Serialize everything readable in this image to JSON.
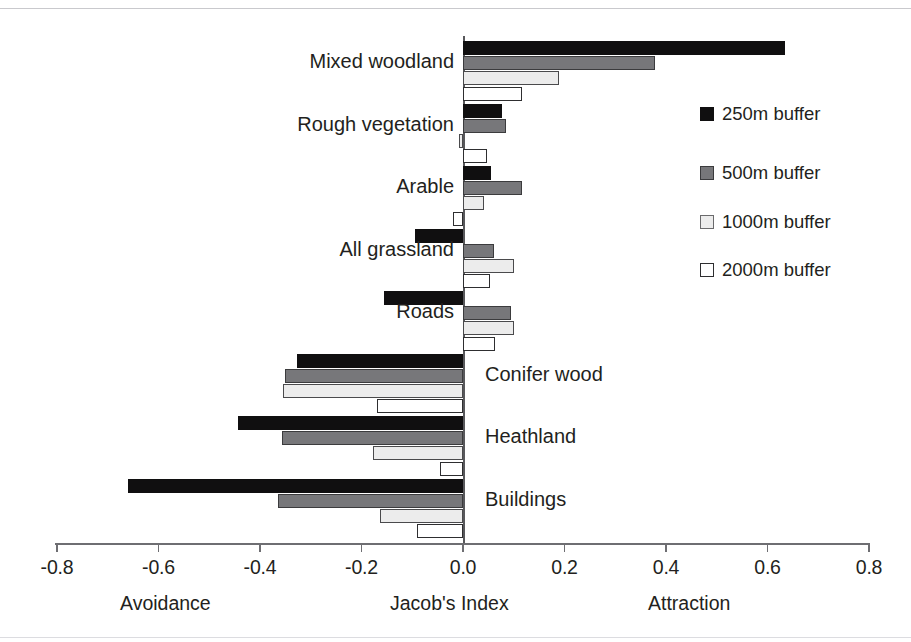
{
  "chart_data": {
    "type": "bar",
    "orientation": "horizontal",
    "title": "",
    "xlabel": "Jacob's Index",
    "ylabel": "",
    "xlim": [
      -0.8,
      0.8
    ],
    "grid": false,
    "x_ticks": [
      -0.8,
      -0.6,
      -0.4,
      -0.2,
      0.0,
      0.2,
      0.4,
      0.6,
      0.8
    ],
    "x_tick_labels": [
      "-0.8",
      "-0.6",
      "-0.4",
      "-0.2",
      "0.0",
      "0.2",
      "0.4",
      "0.6",
      "0.8"
    ],
    "axis_captions": {
      "left": "Avoidance",
      "center": "Jacob's Index",
      "right": "Attraction"
    },
    "categories": [
      "Mixed woodland",
      "Rough vegetation",
      "Arable",
      "All grassland",
      "Roads",
      "Conifer wood",
      "Heathland",
      "Buildings"
    ],
    "legend_position": "right",
    "series": [
      {
        "name": "250m buffer",
        "color": "#100f10",
        "values": [
          0.635,
          0.076,
          0.055,
          -0.095,
          -0.155,
          -0.327,
          -0.443,
          -0.66
        ]
      },
      {
        "name": "500m buffer",
        "color": "#77777a",
        "values": [
          0.378,
          0.085,
          0.117,
          0.062,
          0.094,
          -0.351,
          -0.357,
          -0.365
        ]
      },
      {
        "name": "1000m buffer",
        "color": "#ececec",
        "values": [
          0.19,
          -0.007,
          0.042,
          0.1,
          0.1,
          -0.355,
          -0.177,
          -0.163
        ]
      },
      {
        "name": "2000m buffer",
        "color": "#ffffff",
        "values": [
          0.117,
          0.048,
          -0.019,
          0.054,
          0.064,
          -0.17,
          -0.045,
          -0.09
        ]
      }
    ],
    "category_label_side": [
      "right",
      "right",
      "right",
      "right",
      "right",
      "left",
      "left",
      "left"
    ]
  },
  "legend": {
    "items": [
      {
        "label": "250m buffer",
        "swatch": "black-square-icon"
      },
      {
        "label": "500m buffer",
        "swatch": "dark-gray-square-icon"
      },
      {
        "label": "1000m buffer",
        "swatch": "light-gray-square-icon"
      },
      {
        "label": "2000m buffer",
        "swatch": "white-square-icon"
      }
    ]
  }
}
